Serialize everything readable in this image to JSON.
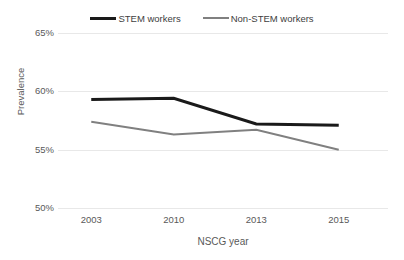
{
  "chart_data": {
    "type": "line",
    "title": "",
    "xlabel": "NSCG year",
    "ylabel": "Prevalence",
    "categories": [
      "2003",
      "2010",
      "2013",
      "2015"
    ],
    "x_tick_labels": [
      "2003",
      "2010",
      "2013",
      "2015"
    ],
    "y_tick_labels": [
      "65%",
      "60%",
      "55%",
      "50%"
    ],
    "y_tick_values": [
      65,
      60,
      55,
      50
    ],
    "ylim": [
      50,
      65
    ],
    "grid": "horizontal",
    "legend_position": "top-center",
    "series": [
      {
        "name": "STEM workers",
        "color": "#1a1a1a",
        "width": 3,
        "values": [
          59.3,
          59.4,
          57.2,
          57.1
        ]
      },
      {
        "name": "Non-STEM workers",
        "color": "#808080",
        "width": 2,
        "values": [
          57.4,
          56.3,
          56.7,
          55.0
        ]
      }
    ]
  },
  "legend": {
    "entries": [
      {
        "label": "STEM workers"
      },
      {
        "label": "Non-STEM workers"
      }
    ]
  },
  "colors": {
    "stem_line": "#1a1a1a",
    "non_stem_line": "#808080",
    "gridline": "#e8e8e8",
    "text": "#595959",
    "background": "#ffffff"
  }
}
